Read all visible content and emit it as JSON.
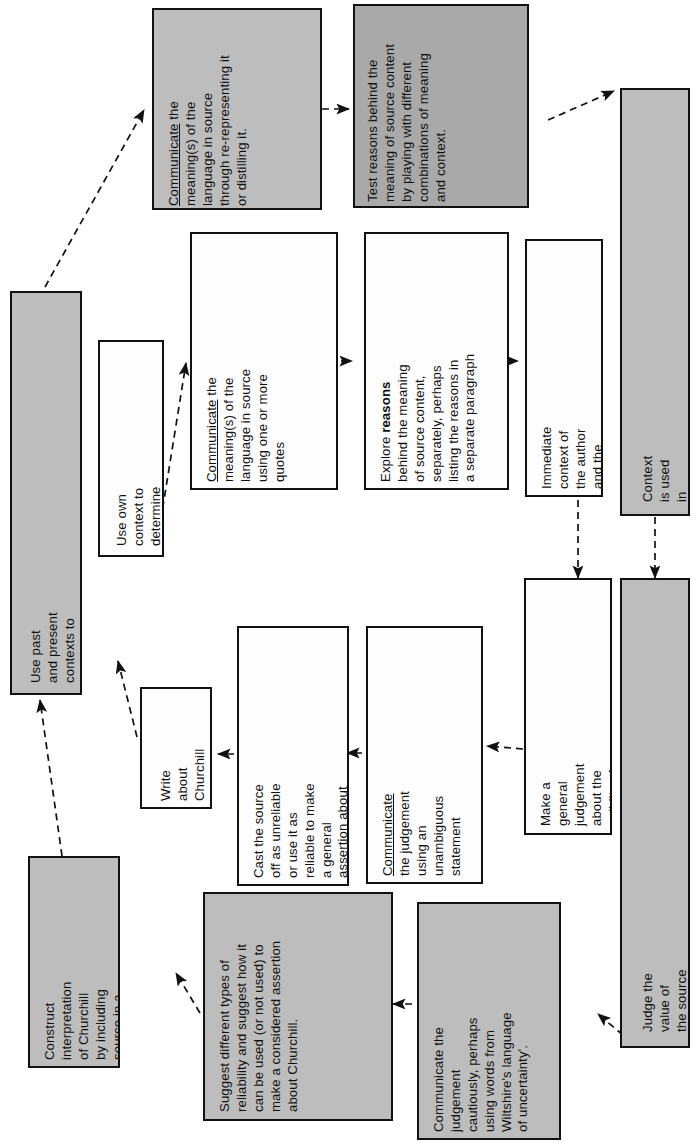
{
  "diagram": {
    "orientation": "text rotated 90 degrees counter-clockwise",
    "palette": {
      "page_background": "#ffffff",
      "box_border": "#111111",
      "fill_light": "#ececec",
      "fill_white": "#fdfdfd",
      "fill_mid_grey": "#bdbdbd",
      "fill_dark_grey": "#a9a9a9",
      "connector": "#111111"
    },
    "nodes": [
      {
        "id": "communicate-re-representing",
        "text": "Communicate the meaning(s) of the language in source through re-representing it or distilling it.",
        "fill": "mid"
      },
      {
        "id": "test-reasons",
        "text": "Test reasons behind the meaning of source content by playing with different combinations of meaning and context.",
        "fill": "dark"
      },
      {
        "id": "context-spatial-temporal",
        "text": "Context is used in different spatial and temporal scales",
        "fill": "mid"
      },
      {
        "id": "communicate-quotes",
        "text": "Communicate the meaning(s) of the language in source using one or more quotes",
        "fill": "white"
      },
      {
        "id": "explore-reasons",
        "text": "Explore reasons behind the meaning of source content, separately, perhaps listing the reasons in a separate paragraph",
        "fill": "white"
      },
      {
        "id": "immediate-context",
        "text": "Immediate context of the author and the time is used",
        "fill": "white"
      },
      {
        "id": "past-present-contexts",
        "text": "Use past and present contexts to comprehend more than one meaning of source content.",
        "fill": "mid"
      },
      {
        "id": "own-context",
        "text": "Use own context to determine a single meaning of the source content",
        "fill": "white"
      },
      {
        "id": "write-about-churchill",
        "text": "Write about Churchill",
        "fill": "white"
      },
      {
        "id": "cast-source-off",
        "text": "Cast the source off as unreliable or use it as reliable to make a general assertion about Churchill",
        "fill": "white"
      },
      {
        "id": "communicate-unambiguous",
        "text": "Communicate the judgement using an unambiguous statement",
        "fill": "white"
      },
      {
        "id": "make-general-judgement",
        "text": "Make a general judgement about the validity of any finding using a universal standard",
        "fill": "white"
      },
      {
        "id": "judge-value-of-source",
        "text": "Judge the value of the source (to a subsequent historical enquiry) according to the purpose of using it",
        "fill": "mid"
      },
      {
        "id": "construct-interpretation",
        "text": "Construct interpretation of Churchill by including source in a driven argument.",
        "fill": "mid"
      },
      {
        "id": "suggest-types-of-reliability",
        "text": "Suggest different types of reliability and suggest how it can be used (or not used) to make a considered assertion about Churchill.",
        "fill": "mid"
      },
      {
        "id": "communicate-cautiously",
        "text": "Communicate the judgement cautiously, perhaps using words from Wiltshire's language of uncertainty'.",
        "fill": "mid"
      }
    ],
    "edges": [
      {
        "from": "past-present-contexts",
        "to": "communicate-re-representing",
        "style": "dashed-arrow"
      },
      {
        "from": "communicate-re-representing",
        "to": "test-reasons",
        "style": "dashed-arrow"
      },
      {
        "from": "test-reasons",
        "to": "context-spatial-temporal",
        "style": "dashed-arrow"
      },
      {
        "from": "own-context",
        "to": "communicate-quotes",
        "style": "dashed-arrow"
      },
      {
        "from": "communicate-quotes",
        "to": "explore-reasons",
        "style": "dashed-arrow"
      },
      {
        "from": "explore-reasons",
        "to": "immediate-context",
        "style": "dashed-arrow"
      },
      {
        "from": "immediate-context",
        "to": "make-general-judgement",
        "style": "dashed-arrow"
      },
      {
        "from": "context-spatial-temporal",
        "to": "judge-value-of-source",
        "style": "dashed-arrow"
      },
      {
        "from": "make-general-judgement",
        "to": "communicate-unambiguous",
        "style": "dashed-arrow"
      },
      {
        "from": "communicate-unambiguous",
        "to": "cast-source-off",
        "style": "dashed-arrow"
      },
      {
        "from": "cast-source-off",
        "to": "write-about-churchill",
        "style": "dashed-arrow"
      },
      {
        "from": "write-about-churchill",
        "to": "own-context",
        "style": "dashed-arrow"
      },
      {
        "from": "judge-value-of-source",
        "to": "communicate-cautiously",
        "style": "dashed-arrow"
      },
      {
        "from": "communicate-cautiously",
        "to": "suggest-types-of-reliability",
        "style": "dashed-arrow"
      },
      {
        "from": "suggest-types-of-reliability",
        "to": "construct-interpretation",
        "style": "dashed-arrow"
      },
      {
        "from": "construct-interpretation",
        "to": "past-present-contexts",
        "style": "dashed-arrow"
      }
    ]
  }
}
